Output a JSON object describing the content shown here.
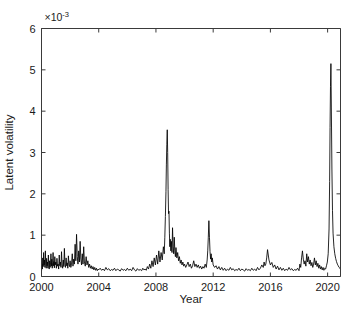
{
  "figure": {
    "background": "#ffffff",
    "line_color": "#000000",
    "axis_color": "#3a3a3a"
  },
  "chart_data": {
    "type": "line",
    "title": "",
    "subtitle": "",
    "xlabel": "Year",
    "ylabel": "Latent volatility",
    "exponent_label": "×10",
    "exponent_value": "-3",
    "exponent_full": "×10⁻³",
    "y_scale_factor": 0.001,
    "xlim": [
      2000,
      2020.9
    ],
    "ylim": [
      0,
      6
    ],
    "xticks": [
      2000,
      2004,
      2008,
      2012,
      2016,
      2020
    ],
    "xticklabels": [
      "2000",
      "2004",
      "2008",
      "2012",
      "2016",
      "2020"
    ],
    "yticks": [
      0,
      1,
      2,
      3,
      4,
      5,
      6
    ],
    "yticklabels": [
      "0",
      "1",
      "2",
      "3",
      "4",
      "5",
      "6"
    ],
    "grid": false,
    "legend": null,
    "legend_position": "none",
    "tick_direction": "in",
    "box": true,
    "series": [
      {
        "name": "Latent volatility",
        "color": "#000000",
        "units": "×10⁻³",
        "x": [
          2000.0,
          2000.03,
          2000.06,
          2000.09,
          2000.12,
          2000.15,
          2000.18,
          2000.21,
          2000.24,
          2000.27,
          2000.3,
          2000.33,
          2000.36,
          2000.39,
          2000.42,
          2000.45,
          2000.48,
          2000.51,
          2000.54,
          2000.57,
          2000.6,
          2000.63,
          2000.66,
          2000.69,
          2000.72,
          2000.75,
          2000.78,
          2000.81,
          2000.84,
          2000.87,
          2000.9,
          2000.93,
          2000.96,
          2001.0,
          2001.04,
          2001.08,
          2001.12,
          2001.16,
          2001.2,
          2001.24,
          2001.28,
          2001.32,
          2001.36,
          2001.4,
          2001.44,
          2001.48,
          2001.52,
          2001.56,
          2001.6,
          2001.64,
          2001.68,
          2001.72,
          2001.76,
          2001.8,
          2001.84,
          2001.88,
          2001.92,
          2001.96,
          2002.0,
          2002.05,
          2002.1,
          2002.15,
          2002.2,
          2002.25,
          2002.3,
          2002.35,
          2002.4,
          2002.45,
          2002.5,
          2002.55,
          2002.6,
          2002.65,
          2002.7,
          2002.75,
          2002.8,
          2002.85,
          2002.9,
          2002.95,
          2003.0,
          2003.06,
          2003.12,
          2003.18,
          2003.24,
          2003.3,
          2003.36,
          2003.42,
          2003.48,
          2003.54,
          2003.6,
          2003.66,
          2003.72,
          2003.78,
          2003.84,
          2003.9,
          2003.96,
          2004.0,
          2004.1,
          2004.2,
          2004.3,
          2004.4,
          2004.5,
          2004.6,
          2004.7,
          2004.8,
          2004.9,
          2005.0,
          2005.1,
          2005.2,
          2005.3,
          2005.4,
          2005.5,
          2005.6,
          2005.7,
          2005.8,
          2005.9,
          2006.0,
          2006.1,
          2006.2,
          2006.3,
          2006.4,
          2006.5,
          2006.6,
          2006.7,
          2006.8,
          2006.9,
          2007.0,
          2007.08,
          2007.16,
          2007.24,
          2007.32,
          2007.4,
          2007.48,
          2007.56,
          2007.64,
          2007.72,
          2007.8,
          2007.88,
          2007.96,
          2008.04,
          2008.12,
          2008.2,
          2008.28,
          2008.36,
          2008.44,
          2008.52,
          2008.58,
          2008.62,
          2008.66,
          2008.7,
          2008.73,
          2008.76,
          2008.79,
          2008.82,
          2008.85,
          2008.88,
          2008.91,
          2008.94,
          2008.97,
          2009.0,
          2009.04,
          2009.08,
          2009.12,
          2009.16,
          2009.2,
          2009.24,
          2009.28,
          2009.32,
          2009.36,
          2009.4,
          2009.46,
          2009.52,
          2009.58,
          2009.64,
          2009.7,
          2009.76,
          2009.82,
          2009.88,
          2009.94,
          2010.0,
          2010.08,
          2010.16,
          2010.24,
          2010.32,
          2010.4,
          2010.48,
          2010.56,
          2010.64,
          2010.72,
          2010.8,
          2010.88,
          2010.96,
          2011.04,
          2011.12,
          2011.2,
          2011.28,
          2011.36,
          2011.44,
          2011.52,
          2011.58,
          2011.62,
          2011.66,
          2011.7,
          2011.74,
          2011.78,
          2011.82,
          2011.86,
          2011.9,
          2011.94,
          2012.0,
          2012.1,
          2012.2,
          2012.3,
          2012.4,
          2012.5,
          2012.6,
          2012.7,
          2012.8,
          2012.9,
          2013.0,
          2013.1,
          2013.2,
          2013.3,
          2013.4,
          2013.5,
          2013.6,
          2013.7,
          2013.8,
          2013.9,
          2014.0,
          2014.1,
          2014.2,
          2014.3,
          2014.4,
          2014.5,
          2014.6,
          2014.7,
          2014.8,
          2014.9,
          2015.0,
          2015.1,
          2015.2,
          2015.3,
          2015.4,
          2015.5,
          2015.56,
          2015.62,
          2015.68,
          2015.74,
          2015.8,
          2015.9,
          2016.0,
          2016.1,
          2016.2,
          2016.3,
          2016.4,
          2016.5,
          2016.6,
          2016.7,
          2016.8,
          2016.9,
          2017.0,
          2017.1,
          2017.2,
          2017.3,
          2017.4,
          2017.5,
          2017.6,
          2017.7,
          2017.8,
          2017.9,
          2018.0,
          2018.06,
          2018.12,
          2018.18,
          2018.24,
          2018.3,
          2018.36,
          2018.42,
          2018.48,
          2018.54,
          2018.6,
          2018.66,
          2018.72,
          2018.78,
          2018.84,
          2018.9,
          2018.96,
          2019.02,
          2019.08,
          2019.14,
          2019.2,
          2019.26,
          2019.32,
          2019.38,
          2019.44,
          2019.5,
          2019.56,
          2019.62,
          2019.68,
          2019.74,
          2019.8,
          2019.86,
          2019.92,
          2019.98,
          2020.04,
          2020.1,
          2020.14,
          2020.17,
          2020.2,
          2020.23,
          2020.26,
          2020.3,
          2020.34,
          2020.38,
          2020.44,
          2020.5,
          2020.56,
          2020.62,
          2020.68,
          2020.74,
          2020.8,
          2020.86,
          2020.9
        ],
        "y": [
          0.12,
          0.3,
          0.18,
          0.45,
          0.24,
          0.58,
          0.28,
          0.4,
          0.22,
          0.62,
          0.3,
          0.2,
          0.44,
          0.26,
          0.35,
          0.2,
          0.52,
          0.28,
          0.18,
          0.38,
          0.22,
          0.3,
          0.55,
          0.25,
          0.42,
          0.2,
          0.33,
          0.58,
          0.26,
          0.36,
          0.21,
          0.48,
          0.28,
          0.35,
          0.2,
          0.44,
          0.25,
          0.3,
          0.18,
          0.52,
          0.26,
          0.35,
          0.22,
          0.6,
          0.28,
          0.2,
          0.4,
          0.24,
          0.68,
          0.3,
          0.22,
          0.45,
          0.26,
          0.33,
          0.2,
          0.5,
          0.28,
          0.24,
          0.38,
          0.22,
          0.3,
          0.55,
          0.25,
          0.42,
          0.3,
          0.78,
          0.38,
          1.02,
          0.48,
          0.3,
          0.62,
          0.35,
          0.85,
          0.42,
          0.28,
          0.55,
          0.3,
          0.72,
          0.35,
          0.25,
          0.48,
          0.28,
          0.38,
          0.22,
          0.3,
          0.2,
          0.26,
          0.18,
          0.24,
          0.16,
          0.22,
          0.15,
          0.2,
          0.14,
          0.18,
          0.16,
          0.2,
          0.15,
          0.18,
          0.14,
          0.22,
          0.16,
          0.19,
          0.14,
          0.17,
          0.15,
          0.2,
          0.14,
          0.18,
          0.16,
          0.13,
          0.19,
          0.15,
          0.17,
          0.14,
          0.2,
          0.15,
          0.18,
          0.14,
          0.22,
          0.16,
          0.13,
          0.19,
          0.15,
          0.17,
          0.14,
          0.2,
          0.16,
          0.18,
          0.15,
          0.24,
          0.18,
          0.3,
          0.2,
          0.38,
          0.24,
          0.45,
          0.28,
          0.52,
          0.3,
          0.62,
          0.35,
          0.58,
          0.4,
          0.72,
          0.55,
          0.95,
          1.45,
          2.05,
          2.7,
          3.2,
          3.55,
          3.0,
          2.1,
          1.52,
          1.58,
          1.05,
          0.72,
          0.9,
          0.62,
          0.85,
          0.58,
          1.18,
          0.72,
          0.55,
          0.95,
          0.62,
          0.48,
          0.7,
          0.45,
          0.58,
          0.38,
          0.48,
          0.32,
          0.4,
          0.28,
          0.35,
          0.25,
          0.3,
          0.22,
          0.28,
          0.35,
          0.24,
          0.3,
          0.2,
          0.26,
          0.38,
          0.24,
          0.3,
          0.22,
          0.28,
          0.2,
          0.25,
          0.18,
          0.24,
          0.2,
          0.3,
          0.22,
          0.4,
          0.62,
          0.95,
          1.35,
          0.95,
          0.6,
          0.42,
          0.55,
          0.35,
          0.45,
          0.28,
          0.22,
          0.26,
          0.18,
          0.24,
          0.16,
          0.22,
          0.15,
          0.2,
          0.14,
          0.18,
          0.15,
          0.22,
          0.16,
          0.19,
          0.14,
          0.17,
          0.15,
          0.2,
          0.14,
          0.18,
          0.16,
          0.13,
          0.19,
          0.15,
          0.17,
          0.14,
          0.2,
          0.15,
          0.18,
          0.14,
          0.22,
          0.16,
          0.2,
          0.28,
          0.22,
          0.35,
          0.26,
          0.3,
          0.45,
          0.65,
          0.4,
          0.28,
          0.34,
          0.22,
          0.28,
          0.18,
          0.25,
          0.16,
          0.22,
          0.15,
          0.2,
          0.14,
          0.18,
          0.15,
          0.22,
          0.16,
          0.19,
          0.14,
          0.17,
          0.15,
          0.2,
          0.14,
          0.3,
          0.22,
          0.45,
          0.62,
          0.42,
          0.3,
          0.38,
          0.25,
          0.55,
          0.35,
          0.48,
          0.3,
          0.4,
          0.26,
          0.34,
          0.22,
          0.3,
          0.45,
          0.28,
          0.38,
          0.24,
          0.32,
          0.2,
          0.28,
          0.18,
          0.24,
          0.16,
          0.22,
          0.15,
          0.2,
          0.18,
          0.26,
          0.35,
          0.55,
          1.15,
          2.3,
          3.6,
          4.6,
          5.15,
          4.1,
          2.6,
          1.6,
          1.05,
          0.72,
          0.55,
          0.44,
          0.36,
          0.3,
          0.26,
          0.22,
          0.2,
          0.18
        ]
      }
    ]
  }
}
